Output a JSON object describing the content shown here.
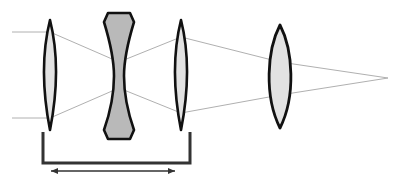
{
  "diagram": {
    "type": "optical-ray-diagram",
    "canvas": {
      "width": 410,
      "height": 180,
      "background": "#ffffff"
    },
    "colors": {
      "lens_outline": "#111111",
      "lens_fill_light": "#e2e2e2",
      "lens_fill_dark": "#b9b9b9",
      "ray_line": "#b0b0b0",
      "dimension_line": "#333333"
    },
    "elements": [
      {
        "id": "lens-1",
        "label": "Front biconvex lens",
        "shape": "biconvex",
        "fill": "#e2e2e2",
        "x_center": 50,
        "x_left": 41,
        "x_right": 59,
        "y_top": 20,
        "y_bottom": 130,
        "edge_thickness": 2,
        "center_thickness": 18
      },
      {
        "id": "lens-2",
        "label": "Middle biconcave lens",
        "shape": "biconcave",
        "fill": "#b9b9b9",
        "x_center": 119,
        "x_left": 104,
        "x_right": 134,
        "y_top": 13,
        "y_bottom": 139,
        "edge_thickness": 30,
        "center_thickness": 11
      },
      {
        "id": "lens-3",
        "label": "Rear biconvex lens",
        "shape": "biconvex",
        "fill": "#e2e2e2",
        "x_center": 181,
        "x_left": 173,
        "x_right": 190,
        "y_top": 20,
        "y_bottom": 130,
        "edge_thickness": 2,
        "center_thickness": 17
      },
      {
        "id": "lens-4",
        "label": "Focusing biconvex lens",
        "shape": "biconvex",
        "fill": "#e2e2e2",
        "x_center": 280,
        "x_left": 264,
        "x_right": 296,
        "y_top": 25,
        "y_bottom": 128,
        "edge_thickness": 3,
        "center_thickness": 32
      }
    ],
    "rays": [
      {
        "id": "ray-upper",
        "label": "Upper marginal ray",
        "points": [
          [
            12,
            32
          ],
          [
            50,
            32
          ],
          [
            119,
            62
          ],
          [
            181,
            37
          ],
          [
            280,
            62
          ],
          [
            388,
            78
          ]
        ]
      },
      {
        "id": "ray-lower",
        "label": "Lower marginal ray",
        "points": [
          [
            12,
            118
          ],
          [
            50,
            118
          ],
          [
            119,
            88
          ],
          [
            181,
            113
          ],
          [
            280,
            95
          ],
          [
            388,
            78
          ]
        ]
      }
    ],
    "focal_point": {
      "label": "Image focal point",
      "x": 388,
      "y": 78
    },
    "dimension": {
      "id": "zoom-group-span",
      "label": "Zoom group spacing",
      "value_text": "",
      "bracket": {
        "x_left": 43,
        "x_right": 190,
        "y_bar": 163,
        "tick_top": 132
      },
      "arrow": {
        "x_left": 51,
        "x_right": 175,
        "y": 171
      }
    }
  }
}
